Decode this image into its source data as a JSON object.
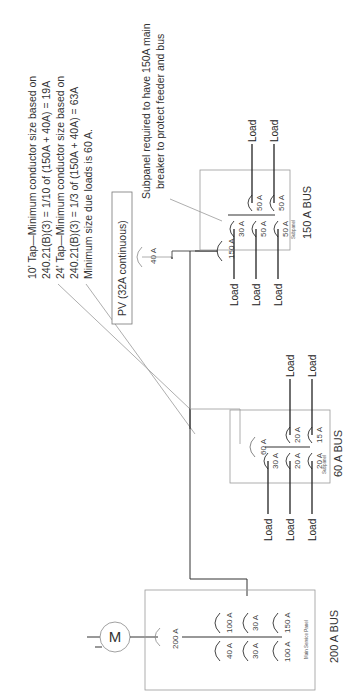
{
  "diagram": {
    "notes": {
      "tap_note": [
        "10' Tap—Minimum conductor size based on",
        "240.21(B)(3) = 1/10 of (150A + 40A) = 19A",
        "24' Tap—Minimum conductor size based on",
        "240.21(B)(3) = 1/3 of (150A + 40A) = 63A",
        "Minimum size due loads is 60 A."
      ],
      "subpanel_note": [
        "Subpanel required to have 150A main",
        "breaker to protect feeder and bus"
      ]
    },
    "pv": {
      "label": "PV (32A continuous)",
      "breaker": "40 A"
    },
    "meter": {
      "symbol": "M"
    },
    "main_panel": {
      "main_breaker": "200 A",
      "panel_label": "Main Service Panel",
      "bus_label": "200 A BUS",
      "breakers_top": [
        "100 A",
        "30 A",
        "150 A"
      ],
      "breakers_bottom": [
        "40 A",
        "30 A",
        "100 A"
      ]
    },
    "subpanel_60": {
      "main_breaker": "60 A",
      "panel_label": "Subpanel",
      "bus_label": "60 A BUS",
      "breakers_top": [
        "20 A",
        "15 A"
      ],
      "breakers_bottom": [
        "30 A",
        "20 A",
        "20 A"
      ],
      "loads_top": [
        "Load",
        "Load"
      ],
      "loads_bottom": [
        "Load",
        "Load",
        "Load"
      ]
    },
    "subpanel_150": {
      "main_breaker": "150 A",
      "panel_label": "Subpanel",
      "bus_label": "150 A BUS",
      "breakers_top": [
        "50 A",
        "50 A"
      ],
      "breakers_bottom": [
        "30 A",
        "50 A",
        "50 A"
      ],
      "loads_top": [
        "Load",
        "Load"
      ],
      "loads_bottom": [
        "Load",
        "Load",
        "Load"
      ]
    }
  }
}
